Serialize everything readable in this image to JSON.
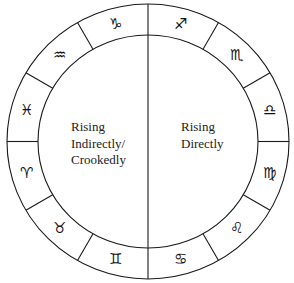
{
  "diagram": {
    "type": "zodiac-wheel",
    "center": {
      "x": 148,
      "y": 141.5
    },
    "outer_radius_x": 141,
    "outer_radius_y": 137.5,
    "ring_width": 31,
    "line_color": "#1a1a1a",
    "segments": [
      {
        "sign": "Capricorn",
        "glyph": "♑",
        "angle_deg": 105
      },
      {
        "sign": "Sagittarius",
        "glyph": "♐",
        "angle_deg": 75
      },
      {
        "sign": "Scorpio",
        "glyph": "♏",
        "angle_deg": 45
      },
      {
        "sign": "Libra",
        "glyph": "♎",
        "angle_deg": 15
      },
      {
        "sign": "Virgo",
        "glyph": "♍",
        "angle_deg": -15
      },
      {
        "sign": "Leo",
        "glyph": "♌",
        "angle_deg": -45
      },
      {
        "sign": "Cancer",
        "glyph": "♋",
        "angle_deg": -75
      },
      {
        "sign": "Gemini",
        "glyph": "♊",
        "angle_deg": -105
      },
      {
        "sign": "Taurus",
        "glyph": "♉",
        "angle_deg": -135
      },
      {
        "sign": "Aries",
        "glyph": "♈",
        "angle_deg": -165
      },
      {
        "sign": "Pisces",
        "glyph": "♓",
        "angle_deg": 165
      },
      {
        "sign": "Aquarius",
        "glyph": "♒",
        "angle_deg": 135
      }
    ]
  },
  "labels": {
    "left": {
      "line1": "Rising",
      "line2": "Indirectly/",
      "line3": "Crookedly"
    },
    "right": {
      "line1": "Rising",
      "line2": "Directly"
    }
  }
}
